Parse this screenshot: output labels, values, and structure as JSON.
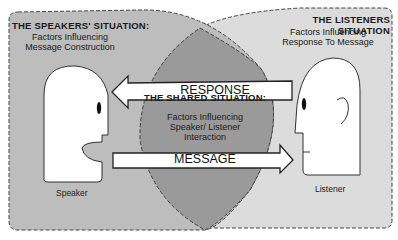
{
  "diagram": {
    "speaker_region": {
      "title": "THE SPEAKERS' SITUATION:",
      "line1": "Factors Influencing",
      "line2": "Message Construction",
      "person_label": "Speaker"
    },
    "listener_region": {
      "title": "THE LISTENERS SITUATION",
      "line1": "Factors Influencing",
      "line2": "Response To Message",
      "person_label": "Listener"
    },
    "shared_region": {
      "title": "THE SHARED SITUATION:",
      "line1": "Factors Influencing",
      "line2": "Speaker/ Listener",
      "line3": "Interaction"
    },
    "arrows": {
      "response": "RESPONSE",
      "message": "MESSAGE"
    },
    "colors": {
      "speaker_fill": "#bdbdbd",
      "listener_fill": "#dcdcdc",
      "shared_fill": "#999999",
      "outline": "#333333",
      "head_fill": "#ffffff"
    }
  }
}
